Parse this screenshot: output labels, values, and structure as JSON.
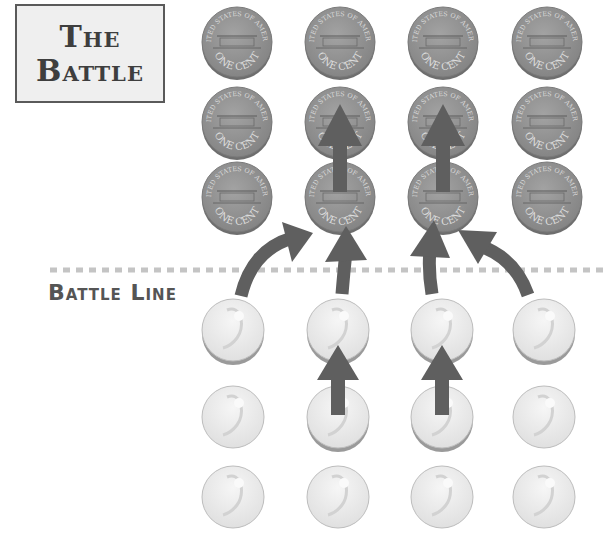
{
  "title": {
    "line1": "The",
    "line2": "Battle"
  },
  "battle_line": {
    "label": "Battle Line",
    "y": 270,
    "x_start": 50,
    "x_end": 606,
    "color": "#c4c4c4"
  },
  "colors": {
    "penny": "#8f8f8f",
    "penny_edge": "#6e6e6e",
    "dime": "#e8e8e8",
    "dime_edge": "#b8b8b8",
    "arrow": "#5f5f5f"
  },
  "pennies": {
    "label_top": "UNITED STATES OF AMERICA",
    "label_bottom": "ONE CENT",
    "columns_x": [
      237,
      340,
      443,
      547
    ],
    "rows_y": [
      42,
      122,
      197
    ],
    "radius": 35
  },
  "dimes": {
    "columns_x": [
      233,
      338,
      442,
      544
    ],
    "rows_y": [
      330,
      417,
      497
    ],
    "radius": 31
  }
}
